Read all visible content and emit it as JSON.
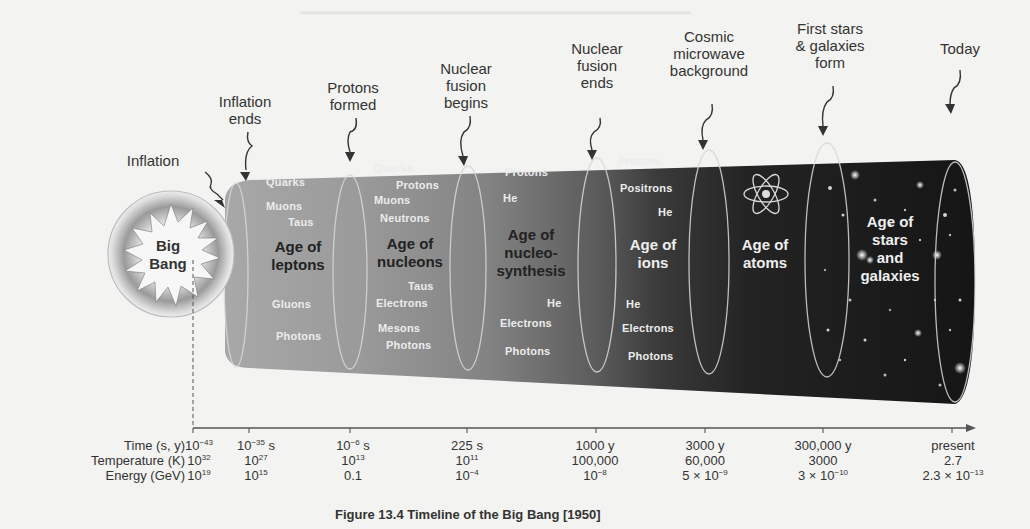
{
  "events": [
    {
      "id": "inflation",
      "label": "Inflation",
      "lines": [
        "Inflation"
      ]
    },
    {
      "id": "inflation-ends",
      "label": "Inflation ends",
      "lines": [
        "Inflation",
        "ends"
      ]
    },
    {
      "id": "protons-formed",
      "label": "Protons formed",
      "lines": [
        "Protons",
        "formed"
      ]
    },
    {
      "id": "nuclear-fusion-begins",
      "label": "Nuclear fusion begins",
      "lines": [
        "Nuclear",
        "fusion",
        "begins"
      ]
    },
    {
      "id": "nuclear-fusion-ends",
      "label": "Nuclear fusion ends",
      "lines": [
        "Nuclear",
        "fusion",
        "ends"
      ]
    },
    {
      "id": "cmb",
      "label": "Cosmic microwave background",
      "lines": [
        "Cosmic",
        "microwave",
        "background"
      ]
    },
    {
      "id": "first-stars",
      "label": "First stars & galaxies form",
      "lines": [
        "First stars",
        "& galaxies",
        "form"
      ]
    },
    {
      "id": "today",
      "label": "Today",
      "lines": [
        "Today"
      ]
    }
  ],
  "big_bang": {
    "lines": [
      "Big",
      "Bang"
    ]
  },
  "ages": [
    {
      "title": [
        "Age of",
        "leptons"
      ],
      "particles": [
        "Quarks",
        "Muons",
        "Taus",
        "Gluons",
        "Photons"
      ]
    },
    {
      "title": [
        "Age of",
        "nucleons"
      ],
      "particles": [
        "Quarks",
        "Protons",
        "Muons",
        "Neutrons",
        "Taus",
        "Electrons",
        "Mesons",
        "Photons"
      ]
    },
    {
      "title": [
        "Age of",
        "nucleo-",
        "synthesis"
      ],
      "particles": [
        "Protons",
        "He",
        "He",
        "Electrons",
        "Photons"
      ]
    },
    {
      "title": [
        "Age of",
        "ions"
      ],
      "particles": [
        "Protons",
        "Positrons",
        "He",
        "He",
        "Electrons",
        "Photons"
      ]
    },
    {
      "title": [
        "Age of",
        "atoms"
      ],
      "particles": [],
      "icon": "atom-icon"
    },
    {
      "title": [
        "Age of",
        "stars",
        "and",
        "galaxies"
      ],
      "particles": []
    }
  ],
  "timeline": {
    "row_labels": [
      "Time (s, y)",
      "Temperature (K)",
      "Energy (GeV)"
    ],
    "ticks": [
      {
        "time": {
          "base": "10",
          "exp": "−43",
          "unit": ""
        },
        "temperature": {
          "base": "10",
          "exp": "32"
        },
        "energy": {
          "base": "10",
          "exp": "19"
        }
      },
      {
        "time": {
          "base": "10",
          "exp": "−35",
          "unit": " s"
        },
        "temperature": {
          "base": "10",
          "exp": "27"
        },
        "energy": {
          "base": "10",
          "exp": "15"
        }
      },
      {
        "time": {
          "base": "10",
          "exp": "−6",
          "unit": " s"
        },
        "temperature": {
          "base": "10",
          "exp": "13"
        },
        "energy": {
          "base": "0.1",
          "exp": ""
        }
      },
      {
        "time": {
          "base": "225 s",
          "exp": "",
          "unit": ""
        },
        "temperature": {
          "base": "10",
          "exp": "11"
        },
        "energy": {
          "base": "10",
          "exp": "−4"
        }
      },
      {
        "time": {
          "base": "1000 y",
          "exp": "",
          "unit": ""
        },
        "temperature": {
          "base": "100,000",
          "exp": ""
        },
        "energy": {
          "base": "10",
          "exp": "−8"
        }
      },
      {
        "time": {
          "base": "3000 y",
          "exp": "",
          "unit": ""
        },
        "temperature": {
          "base": "60,000",
          "exp": ""
        },
        "energy": {
          "base": "5 × 10",
          "exp": "−9"
        }
      },
      {
        "time": {
          "base": "300,000 y",
          "exp": "",
          "unit": ""
        },
        "temperature": {
          "base": "3000",
          "exp": ""
        },
        "energy": {
          "base": "3 × 10",
          "exp": "−10"
        }
      },
      {
        "time": {
          "base": "present",
          "exp": "",
          "unit": ""
        },
        "temperature": {
          "base": "2.7",
          "exp": ""
        },
        "energy": {
          "base": "2.3 × 10",
          "exp": "−13"
        }
      }
    ]
  },
  "caption": "Figure 13.4 Timeline of the Big Bang [1950]",
  "colors": {
    "background": "#f3f3f1",
    "tube_light": "#9a9a9a",
    "tube_dark": "#1c1c1c",
    "text": "#333333",
    "particle_text": "#ececec"
  }
}
